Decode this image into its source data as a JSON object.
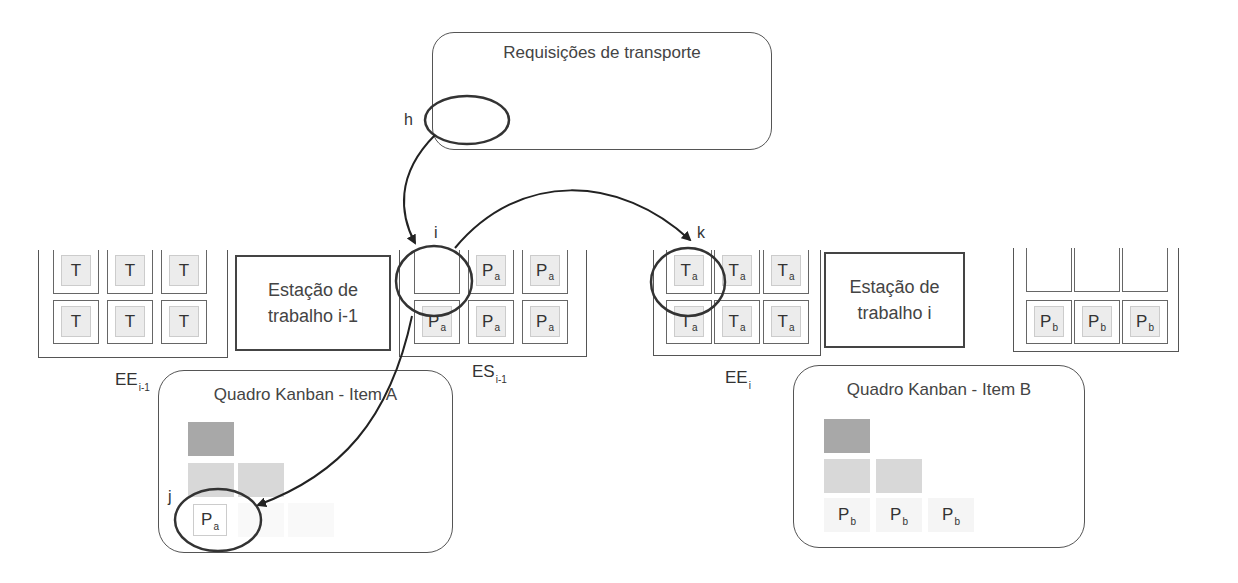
{
  "transport_requests": {
    "title": "Requisições de transporte"
  },
  "station_prev": {
    "label_line1": "Estação de",
    "label_line2": "trabalho i-1"
  },
  "station_curr": {
    "label_line1": "Estação de",
    "label_line2": "trabalho i"
  },
  "buffers": {
    "ee_prev": {
      "label": "EE",
      "sub": "i-1",
      "cards": [
        {
          "main": "T",
          "sub": ""
        },
        {
          "main": "T",
          "sub": ""
        },
        {
          "main": "T",
          "sub": ""
        },
        {
          "main": "T",
          "sub": ""
        },
        {
          "main": "T",
          "sub": ""
        },
        {
          "main": "T",
          "sub": ""
        }
      ]
    },
    "es_prev": {
      "label": "ES",
      "sub": "i-1",
      "cards": [
        {
          "main": "",
          "sub": "",
          "empty": true
        },
        {
          "main": "P",
          "sub": "a"
        },
        {
          "main": "P",
          "sub": "a"
        },
        {
          "main": "P",
          "sub": "a"
        },
        {
          "main": "P",
          "sub": "a"
        },
        {
          "main": "P",
          "sub": "a"
        }
      ]
    },
    "ee_curr": {
      "label": "EE",
      "sub": "i",
      "cards": [
        {
          "main": "T",
          "sub": "a"
        },
        {
          "main": "T",
          "sub": "a"
        },
        {
          "main": "T",
          "sub": "a"
        },
        {
          "main": "T",
          "sub": "a"
        },
        {
          "main": "T",
          "sub": "a"
        },
        {
          "main": "T",
          "sub": "a"
        }
      ]
    },
    "es_curr": {
      "label": "ES",
      "sub": "i",
      "cards": [
        {
          "main": "",
          "sub": "",
          "empty": true
        },
        {
          "main": "",
          "sub": "",
          "empty": true
        },
        {
          "main": "",
          "sub": "",
          "empty": true
        },
        {
          "main": "P",
          "sub": "b"
        },
        {
          "main": "P",
          "sub": "b"
        },
        {
          "main": "P",
          "sub": "b"
        }
      ]
    }
  },
  "kanban_a": {
    "title": "Quadro Kanban - Item A",
    "card": {
      "main": "P",
      "sub": "a"
    }
  },
  "kanban_b": {
    "title": "Quadro Kanban - Item B",
    "cards": [
      {
        "main": "P",
        "sub": "b"
      },
      {
        "main": "P",
        "sub": "b"
      },
      {
        "main": "P",
        "sub": "b"
      }
    ]
  },
  "markers": {
    "h": "h",
    "i": "i",
    "j": "j",
    "k": "k"
  },
  "colors": {
    "line": "#333333",
    "card_dark": "#a8a8a8",
    "card_light": "#d8d8d8",
    "card_bg": "#ececec"
  }
}
